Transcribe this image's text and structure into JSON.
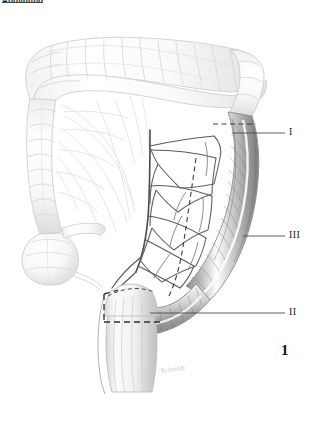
{
  "figure": {
    "number": "1",
    "top_caption": "Abbildung",
    "signature": "R. Schmidt",
    "background_color": "#ffffff",
    "ink_color": "#3a3a3a"
  },
  "labels": [
    {
      "id": "level-1",
      "text": "I",
      "description": "Resection level I - splenic flexure / descending colon",
      "text_x": 289,
      "text_y": 127,
      "leader_x1": 232,
      "leader_y1": 133,
      "leader_x2": 285,
      "leader_y2": 133
    },
    {
      "id": "level-3",
      "text": "III",
      "description": "Resection level III - mid descending / sigmoid colon",
      "text_x": 289,
      "text_y": 230,
      "leader_x1": 243,
      "leader_y1": 236,
      "leader_x2": 285,
      "leader_y2": 236
    },
    {
      "id": "level-2",
      "text": "II",
      "description": "Resection level II - rectosigmoid junction",
      "text_x": 289,
      "text_y": 307,
      "leader_x1": 150,
      "leader_y1": 313,
      "leader_x2": 285,
      "leader_y2": 313
    }
  ],
  "anatomy": {
    "structures": [
      {
        "name": "transverse-colon",
        "shade": "light"
      },
      {
        "name": "ascending-colon",
        "shade": "light"
      },
      {
        "name": "hepatic-flexure",
        "shade": "light"
      },
      {
        "name": "splenic-flexure",
        "shade": "light"
      },
      {
        "name": "cecum",
        "shade": "light"
      },
      {
        "name": "terminal-ileum",
        "shade": "light"
      },
      {
        "name": "appendix",
        "shade": "light"
      },
      {
        "name": "descending-colon",
        "shade": "dark"
      },
      {
        "name": "sigmoid-colon",
        "shade": "dark"
      },
      {
        "name": "rectum",
        "shade": "medium"
      },
      {
        "name": "inferior-mesenteric-artery",
        "shade": "dark"
      },
      {
        "name": "superior-mesenteric-vessels",
        "shade": "faint"
      },
      {
        "name": "marginal-artery-arcade",
        "shade": "dark"
      }
    ],
    "resection_dashed_lines": 3
  }
}
